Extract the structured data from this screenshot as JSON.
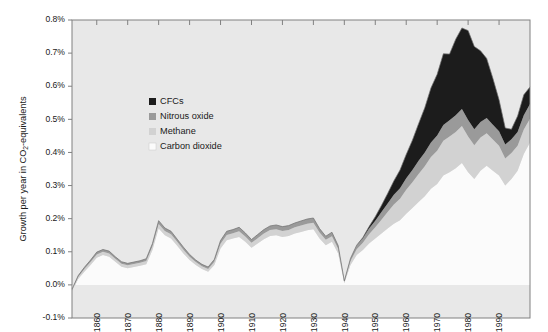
{
  "chart_data": {
    "type": "area",
    "stacked": true,
    "title": "",
    "xlabel": "",
    "ylabel": "Growth per year in CO2-equivalents",
    "ylabel_parts": {
      "before": "Growth per year in CO",
      "sub": "2",
      "after": "-equivalents"
    },
    "ylim": [
      -0.1,
      0.8
    ],
    "xlim": [
      1852,
      2000
    ],
    "y_tick_labels": [
      "0.8%",
      "0.7%",
      "0.6%",
      "0.5%",
      "0.4%",
      "0.3%",
      "0.2%",
      "0.1%",
      "0.0%",
      "-0.1%"
    ],
    "y_tick_values": [
      0.8,
      0.7,
      0.6,
      0.5,
      0.4,
      0.3,
      0.2,
      0.1,
      0.0,
      -0.1
    ],
    "x_tick_labels": [
      "1860",
      "1870",
      "1880",
      "1890",
      "1900",
      "1910",
      "1920",
      "1930",
      "1940",
      "1950",
      "1960",
      "1970",
      "1980",
      "1990"
    ],
    "x_tick_values": [
      1860,
      1870,
      1880,
      1890,
      1900,
      1910,
      1920,
      1930,
      1940,
      1950,
      1960,
      1970,
      1980,
      1990
    ],
    "grid": false,
    "legend_position": "inside-upper-left",
    "plot_background": "#e8e8e8",
    "figure_background": "#ffffff",
    "axis_color": "#808080",
    "legend": [
      {
        "label": "CFCs",
        "color": "#1c1c1c"
      },
      {
        "label": "Nitrous oxide",
        "color": "#9a9a9a"
      },
      {
        "label": "Methane",
        "color": "#d2d2d2"
      },
      {
        "label": "Carbon dioxide",
        "color": "#fbfbfb"
      }
    ],
    "series_stack_order_bottom_to_top": [
      "Carbon dioxide",
      "Methane",
      "Nitrous oxide",
      "CFCs"
    ],
    "x": [
      1852,
      1854,
      1856,
      1858,
      1860,
      1862,
      1864,
      1866,
      1868,
      1870,
      1872,
      1874,
      1876,
      1878,
      1880,
      1882,
      1884,
      1886,
      1888,
      1890,
      1892,
      1894,
      1896,
      1898,
      1900,
      1902,
      1904,
      1906,
      1908,
      1910,
      1912,
      1914,
      1916,
      1918,
      1920,
      1922,
      1924,
      1926,
      1928,
      1930,
      1932,
      1934,
      1936,
      1938,
      1940,
      1942,
      1944,
      1946,
      1948,
      1950,
      1952,
      1954,
      1956,
      1958,
      1960,
      1962,
      1964,
      1966,
      1968,
      1970,
      1972,
      1974,
      1976,
      1978,
      1980,
      1982,
      1984,
      1986,
      1988,
      1990,
      1992,
      1994,
      1996,
      1998,
      2000
    ],
    "series": [
      {
        "name": "Carbon dioxide",
        "color": "#fbfbfb",
        "values": [
          -0.02,
          0.018,
          0.04,
          0.06,
          0.082,
          0.09,
          0.085,
          0.07,
          0.055,
          0.05,
          0.054,
          0.058,
          0.062,
          0.105,
          0.17,
          0.15,
          0.14,
          0.118,
          0.095,
          0.075,
          0.06,
          0.048,
          0.04,
          0.06,
          0.11,
          0.135,
          0.14,
          0.145,
          0.13,
          0.112,
          0.125,
          0.138,
          0.148,
          0.15,
          0.145,
          0.148,
          0.155,
          0.16,
          0.165,
          0.168,
          0.14,
          0.12,
          0.13,
          0.095,
          0.005,
          0.06,
          0.09,
          0.105,
          0.125,
          0.14,
          0.155,
          0.17,
          0.185,
          0.195,
          0.215,
          0.232,
          0.25,
          0.268,
          0.29,
          0.305,
          0.33,
          0.34,
          0.352,
          0.368,
          0.34,
          0.32,
          0.345,
          0.36,
          0.345,
          0.33,
          0.3,
          0.32,
          0.345,
          0.395,
          0.43
        ]
      },
      {
        "name": "Methane",
        "color": "#d2d2d2",
        "values": [
          0.004,
          0.006,
          0.008,
          0.009,
          0.01,
          0.01,
          0.01,
          0.009,
          0.009,
          0.009,
          0.009,
          0.009,
          0.01,
          0.012,
          0.014,
          0.013,
          0.013,
          0.012,
          0.011,
          0.01,
          0.009,
          0.008,
          0.008,
          0.01,
          0.014,
          0.016,
          0.016,
          0.017,
          0.016,
          0.015,
          0.016,
          0.017,
          0.018,
          0.018,
          0.018,
          0.018,
          0.019,
          0.019,
          0.02,
          0.02,
          0.018,
          0.016,
          0.017,
          0.014,
          0.004,
          0.012,
          0.018,
          0.022,
          0.028,
          0.034,
          0.042,
          0.05,
          0.058,
          0.065,
          0.072,
          0.078,
          0.085,
          0.09,
          0.096,
          0.1,
          0.105,
          0.108,
          0.11,
          0.112,
          0.108,
          0.102,
          0.1,
          0.098,
          0.094,
          0.09,
          0.082,
          0.078,
          0.075,
          0.074,
          0.072
        ]
      },
      {
        "name": "Nitrous oxide",
        "color": "#9a9a9a",
        "values": [
          0.003,
          0.004,
          0.005,
          0.006,
          0.007,
          0.007,
          0.007,
          0.006,
          0.006,
          0.006,
          0.006,
          0.006,
          0.007,
          0.008,
          0.01,
          0.009,
          0.009,
          0.008,
          0.008,
          0.007,
          0.006,
          0.006,
          0.006,
          0.007,
          0.01,
          0.011,
          0.011,
          0.012,
          0.011,
          0.01,
          0.011,
          0.012,
          0.012,
          0.013,
          0.013,
          0.013,
          0.013,
          0.014,
          0.014,
          0.014,
          0.012,
          0.011,
          0.012,
          0.01,
          0.003,
          0.008,
          0.012,
          0.014,
          0.017,
          0.02,
          0.023,
          0.026,
          0.029,
          0.032,
          0.035,
          0.037,
          0.04,
          0.042,
          0.044,
          0.046,
          0.048,
          0.049,
          0.05,
          0.051,
          0.05,
          0.048,
          0.047,
          0.046,
          0.045,
          0.044,
          0.042,
          0.042,
          0.042,
          0.043,
          0.044
        ]
      },
      {
        "name": "CFCs",
        "color": "#1c1c1c",
        "values": [
          0,
          0,
          0,
          0,
          0,
          0,
          0,
          0,
          0,
          0,
          0,
          0,
          0,
          0,
          0,
          0,
          0,
          0,
          0,
          0,
          0,
          0,
          0,
          0,
          0,
          0,
          0,
          0,
          0,
          0,
          0,
          0,
          0,
          0,
          0,
          0,
          0,
          0,
          0,
          0,
          0,
          0,
          0,
          0,
          0,
          0,
          0,
          0.002,
          0.006,
          0.012,
          0.02,
          0.03,
          0.042,
          0.055,
          0.072,
          0.09,
          0.112,
          0.135,
          0.165,
          0.185,
          0.215,
          0.2,
          0.23,
          0.245,
          0.27,
          0.25,
          0.215,
          0.18,
          0.14,
          0.095,
          0.05,
          0.03,
          0.048,
          0.062,
          0.052
        ]
      }
    ],
    "annotations": [
      {
        "text": "Peak total growth ~0.78% around 1979-1981"
      },
      {
        "text": "Sharp minimum near 0.0% at 1940"
      },
      {
        "text": "Early peak ~0.19% at 1880"
      }
    ]
  }
}
